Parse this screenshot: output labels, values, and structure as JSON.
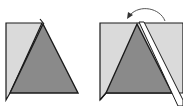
{
  "diagram": {
    "colors": {
      "background": "#ffffff",
      "light_panel": "#dadada",
      "triangle": "#8a8a8a",
      "outline": "#1a1a1a",
      "arrow": "#555555"
    },
    "panels": [
      {
        "id": "step-1",
        "label": ""
      },
      {
        "id": "step-2",
        "label": ""
      }
    ],
    "arrow": {
      "icon": "curved-fold-arrow-icon",
      "direction": "counterclockwise-left"
    }
  }
}
